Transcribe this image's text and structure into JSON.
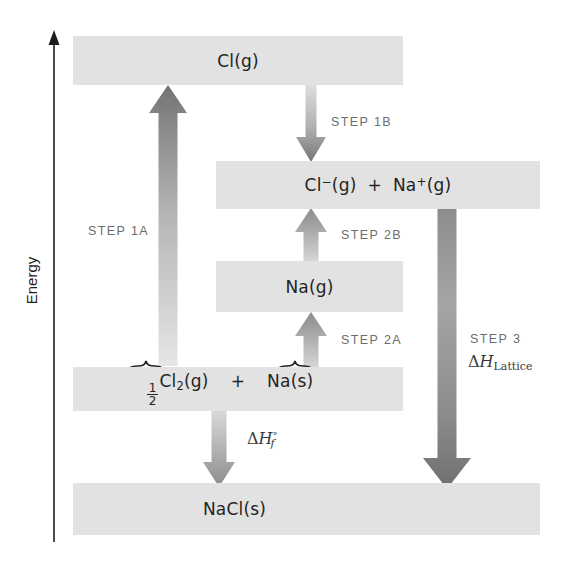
{
  "diagram": {
    "axis": {
      "label": "Energy",
      "direction": "up"
    },
    "colors": {
      "bar_fill": "#e2e2e2",
      "arrow_dark": "#7d7d7d",
      "arrow_light": "#d8d8d8",
      "text": "#242424",
      "step_text": "#6d6d6d",
      "axis": "#1d1d1d"
    },
    "levels": [
      {
        "id": "cl-g",
        "label": "Cl(g)"
      },
      {
        "id": "ions-g",
        "label": "Cl−(g) + Na+(g)"
      },
      {
        "id": "na-g",
        "label": "Na(g)"
      },
      {
        "id": "reactants",
        "label": "½Cl2(g) + Na(s)"
      },
      {
        "id": "nacl-s",
        "label": "NaCl(s)"
      }
    ],
    "reactant_terms": {
      "half": "1",
      "half_den": "2",
      "cl2": "Cl",
      "cl2_sub": "2",
      "cl2_state": "(g)",
      "plus": "+",
      "na": "Na(s)"
    },
    "ions_terms": {
      "cl": "Cl",
      "cl_charge": "−",
      "cl_state": "(g)",
      "plus": "+",
      "na": "Na",
      "na_charge": "+",
      "na_state": "(g)"
    },
    "steps": [
      {
        "id": "step-1a",
        "label": "STEP 1A",
        "direction": "up",
        "from": "reactants",
        "to": "cl-g"
      },
      {
        "id": "step-1b",
        "label": "STEP 1B",
        "direction": "down",
        "from": "cl-g",
        "to": "ions-g"
      },
      {
        "id": "step-2a",
        "label": "STEP 2A",
        "direction": "up",
        "from": "reactants",
        "to": "na-g"
      },
      {
        "id": "step-2b",
        "label": "STEP 2B",
        "direction": "up",
        "from": "na-g",
        "to": "ions-g"
      },
      {
        "id": "step-3",
        "label": "STEP 3",
        "direction": "down",
        "from": "ions-g",
        "to": "nacl-s"
      }
    ],
    "enthalpies": [
      {
        "id": "lattice",
        "delta": "Δ",
        "H": "H",
        "sub": "Lattice",
        "sup": ""
      },
      {
        "id": "formation",
        "delta": "Δ",
        "H": "H",
        "sub": "f",
        "sup": "°"
      }
    ]
  }
}
